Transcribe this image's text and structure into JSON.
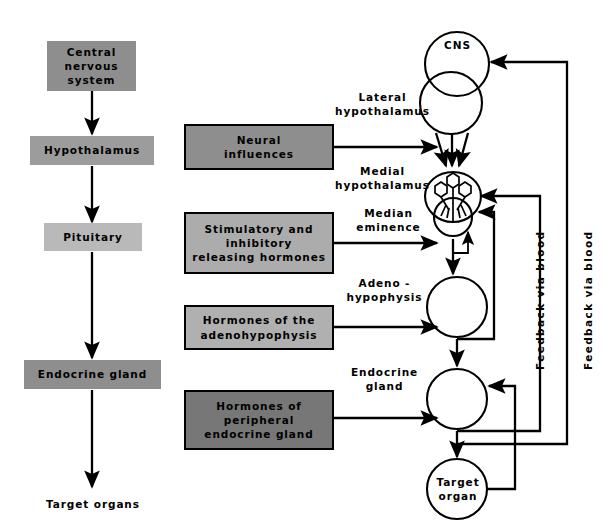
{
  "diagram": {
    "colors": {
      "box_dark": "#8e8e8e",
      "box_mid": "#9c9c9c",
      "box_light": "#b9b9b9",
      "box_darkest": "#777777",
      "stroke": "#000000",
      "background": "#ffffff"
    }
  },
  "left_column": {
    "nodes": [
      {
        "id": "cns",
        "label": "Central\nnervous\nsystem",
        "shade": "dark"
      },
      {
        "id": "hypothalamus",
        "label": "Hypothalamus",
        "shade": "mid"
      },
      {
        "id": "pituitary",
        "label": "Pituitary",
        "shade": "light"
      },
      {
        "id": "endocrine_gland",
        "label": "Endocrine gland",
        "shade": "dark"
      }
    ],
    "terminal_label": "Target organs"
  },
  "input_boxes": [
    {
      "id": "neural_influences",
      "label": "Neural\ninfluences",
      "shade": "g1"
    },
    {
      "id": "releasing_hormones",
      "label": "Stimulatory and\ninhibitory\nreleasing hormones",
      "shade": "g2"
    },
    {
      "id": "adenohypophysis_h",
      "label": "Hormones of the\nadenohypophysis",
      "shade": "g3"
    },
    {
      "id": "peripheral_h",
      "label": "Hormones of\nperipheral\nendocrine gland",
      "shade": "g4"
    }
  ],
  "right_column": {
    "structures": [
      {
        "id": "cns_circle",
        "label": "CNS",
        "shape": "circle-pair"
      },
      {
        "id": "lateral_hypothalamus",
        "label": "Lateral\nhypothalamus",
        "shape": "side-label"
      },
      {
        "id": "medial_hypothalamus",
        "label": "Medial\nhypothalamus",
        "shape": "neuron-body"
      },
      {
        "id": "median_eminence",
        "label": "Median\neminence",
        "shape": "small-circle"
      },
      {
        "id": "adenohypophysis",
        "label": "Adeno -\nhypophysis",
        "shape": "circle"
      },
      {
        "id": "endocrine_gland_r",
        "label": "Endocrine\ngland",
        "shape": "circle"
      },
      {
        "id": "target_organ",
        "label": "Target\norgan",
        "shape": "circle"
      }
    ]
  },
  "feedback_labels": [
    {
      "id": "feedback_inner",
      "label": "Feedback via blood"
    },
    {
      "id": "feedback_outer",
      "label": "Feedback via blood"
    }
  ]
}
